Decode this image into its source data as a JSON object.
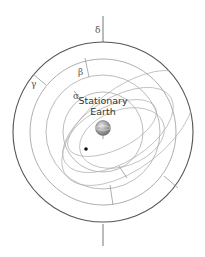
{
  "diagram": {
    "title": "Stationary Earth",
    "labels": {
      "delta": "δ",
      "gamma": "γ",
      "beta": "β",
      "alpha": "α",
      "earth_line1": "Stationary",
      "earth_line2": "Earth"
    },
    "colors": {
      "outer_stroke": "#555555",
      "inner_stroke": "#a8a8a8",
      "earth_fill": "#9a9a9a",
      "planet": "#111111"
    }
  }
}
